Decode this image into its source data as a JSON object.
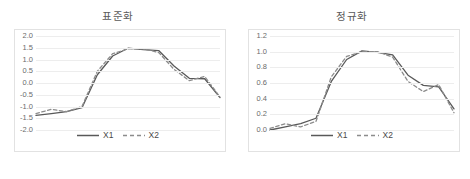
{
  "charts": [
    {
      "title": "표준화",
      "y_ticks": [
        "2.0",
        "1.5",
        "1.0",
        "0.5",
        "0.0",
        "-0.5",
        "-1.0",
        "-1.5",
        "-2.0"
      ],
      "legend": [
        {
          "label": "X1",
          "style": "solid"
        },
        {
          "label": "X2",
          "style": "dashed"
        }
      ]
    },
    {
      "title": "정규화",
      "y_ticks": [
        "1.2",
        "1.0",
        "0.8",
        "0.6",
        "0.4",
        "0.2",
        "0.0"
      ],
      "legend": [
        {
          "label": "X1",
          "style": "solid"
        },
        {
          "label": "X2",
          "style": "dashed"
        }
      ]
    }
  ],
  "chart_data": [
    {
      "type": "line",
      "title": "표준화",
      "xlabel": "",
      "ylabel": "",
      "ylim": [
        -2.0,
        2.0
      ],
      "ytick_values": [
        2.0,
        1.5,
        1.0,
        0.5,
        0.0,
        -0.5,
        -1.0,
        -1.5,
        -2.0
      ],
      "grid": true,
      "legend_position": "bottom",
      "x": [
        1,
        2,
        3,
        4,
        5,
        6,
        7,
        8,
        9,
        10,
        11,
        12
      ],
      "series": [
        {
          "name": "X1",
          "style": "solid",
          "color": "#595959",
          "values": [
            -1.38,
            -1.3,
            -1.22,
            -1.05,
            0.35,
            1.15,
            1.48,
            1.42,
            1.38,
            0.72,
            0.2,
            0.18,
            -0.62
          ]
        },
        {
          "name": "X2",
          "style": "dashed",
          "color": "#8c8c8c",
          "values": [
            -1.3,
            -1.12,
            -1.22,
            -1.0,
            0.5,
            1.25,
            1.45,
            1.45,
            1.3,
            0.58,
            0.1,
            0.28,
            -0.6
          ]
        }
      ]
    },
    {
      "type": "line",
      "title": "정규화",
      "xlabel": "",
      "ylabel": "",
      "ylim": [
        0.0,
        1.2
      ],
      "ytick_values": [
        1.2,
        1.0,
        0.8,
        0.6,
        0.4,
        0.2,
        0.0
      ],
      "grid": true,
      "legend_position": "bottom",
      "x": [
        1,
        2,
        3,
        4,
        5,
        6,
        7,
        8,
        9,
        10,
        11,
        12
      ],
      "series": [
        {
          "name": "X1",
          "style": "solid",
          "color": "#595959",
          "values": [
            0.0,
            0.04,
            0.08,
            0.15,
            0.62,
            0.9,
            1.01,
            0.99,
            0.96,
            0.7,
            0.57,
            0.55,
            0.27
          ]
        },
        {
          "name": "X2",
          "style": "dashed",
          "color": "#8c8c8c",
          "values": [
            0.02,
            0.08,
            0.04,
            0.11,
            0.68,
            0.94,
            1.0,
            1.0,
            0.93,
            0.62,
            0.49,
            0.58,
            0.22
          ]
        }
      ]
    }
  ]
}
